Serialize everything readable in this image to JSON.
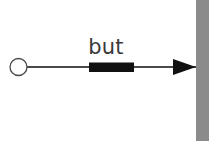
{
  "canvas": {
    "width": 218,
    "height": 141,
    "background_color": "#ffffff"
  },
  "diagram": {
    "type": "arrow-timeline-annotation",
    "label": "but",
    "label_color": "#3a3a3a",
    "nodes": [
      {
        "name": "start-node",
        "shape": "circle-outline",
        "cx": 18.5,
        "cy": 67,
        "r": 8.5,
        "fill": "#ffffff",
        "stroke": "#4a4a4a",
        "stroke_width": 1.3
      }
    ],
    "connector": {
      "name": "arrow-line",
      "x1": 27,
      "y1": 67,
      "x2": 196,
      "y2": 67,
      "color": "#4a4a4a",
      "stroke_width": 1.2
    },
    "highlight_segment": {
      "name": "highlighted-span",
      "x": 89,
      "y": 62.5,
      "width": 45,
      "height": 9.5,
      "color": "#111111"
    },
    "arrow_head": {
      "name": "arrow-head",
      "tip_x": 196,
      "tip_y": 67,
      "back_x": 173,
      "half_height": 8,
      "color": "#111111"
    },
    "terminator_bar": {
      "name": "end-bar",
      "x": 196,
      "y": 0,
      "width": 13,
      "height": 141,
      "color": "#8b8b8b"
    },
    "label_position": {
      "x": 106,
      "y": 54
    }
  }
}
